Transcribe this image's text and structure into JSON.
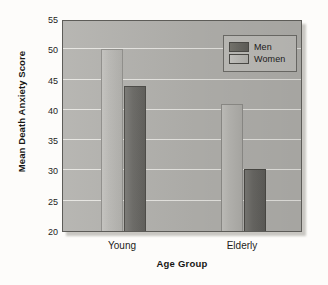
{
  "chart_data": {
    "type": "bar",
    "title": "",
    "subtitle": "",
    "xlabel": "Age Group",
    "ylabel": "Mean Death Anxiety Score",
    "categories": [
      "Young",
      "Elderly"
    ],
    "series": [
      {
        "name": "Men",
        "values": [
          44.0,
          30.3
        ],
        "color": "#65645f"
      },
      {
        "name": "Women",
        "values": [
          50.0,
          41.0
        ],
        "color": "#bab9b5"
      }
    ],
    "ylim": [
      20,
      55
    ],
    "yticks": [
      20,
      25,
      30,
      35,
      40,
      45,
      50,
      55
    ],
    "ytick_labels": [
      "20",
      "25",
      "30",
      "35",
      "40",
      "45",
      "50",
      "55"
    ],
    "grid": true,
    "grid_axis": "y",
    "legend_position": "top-right",
    "bar_order_within_group": [
      "Women",
      "Men"
    ],
    "plot_background": "#b2b1ad",
    "gridline_color": "#efeeea",
    "figure_background": "#fdfcfa"
  }
}
